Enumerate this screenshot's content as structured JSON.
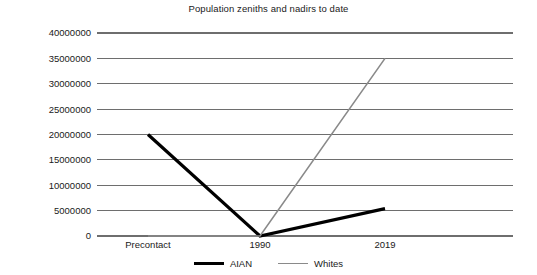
{
  "chart_data": {
    "type": "line",
    "title": "Population zeniths and nadirs to date",
    "xlabel": "",
    "ylabel": "",
    "categories": [
      "Precontact",
      "1990",
      "2019"
    ],
    "ylim": [
      0,
      40000000
    ],
    "ytick_values": [
      0,
      5000000,
      10000000,
      15000000,
      20000000,
      25000000,
      30000000,
      35000000,
      40000000
    ],
    "ytick_labels": [
      "0",
      "5000000",
      "10000000",
      "15000000",
      "20000000",
      "25000000",
      "30000000",
      "35000000",
      "40000000"
    ],
    "grid": true,
    "legend_position": "bottom",
    "series": [
      {
        "name": "AIAN",
        "color": "#000000",
        "values": [
          20000000,
          0,
          5400000
        ]
      },
      {
        "name": "Whites",
        "color": "#8a8a8a",
        "values": [
          0,
          0,
          35000000
        ]
      }
    ]
  },
  "legend": {
    "items": [
      {
        "label": "AIAN"
      },
      {
        "label": "Whites"
      }
    ]
  }
}
